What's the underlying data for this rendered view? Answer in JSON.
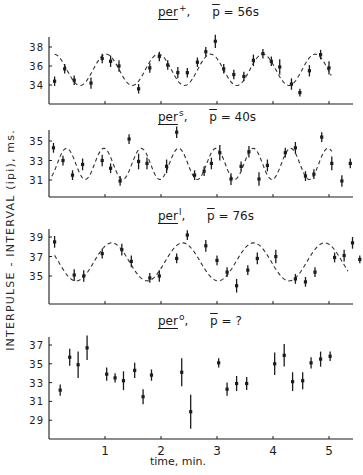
{
  "y_axis_label": "INTERPULSE - INTERVAL (ipi), ms.",
  "x_axis_label": "time, min.",
  "x_ticks": [
    "1",
    "2",
    "3",
    "4",
    "5"
  ],
  "panels": [
    {
      "gene": "per",
      "allele": "+",
      "period_label": "p",
      "period_value": "= 56s"
    },
    {
      "gene": "per",
      "allele": "s",
      "period_label": "p",
      "period_value": "= 40s"
    },
    {
      "gene": "per",
      "allele": "l",
      "period_label": "p",
      "period_value": "= 76s"
    },
    {
      "gene": "per",
      "allele": "o",
      "period_label": "p",
      "period_value": "= ?"
    }
  ],
  "chart_data": [
    {
      "type": "scatter",
      "title": "per+, p̄ = 56s",
      "xlabel": "time, min.",
      "ylabel": "INTERPULSE - INTERVAL (ipi), ms.",
      "xlim": [
        0,
        5.43
      ],
      "ylim": [
        32.0,
        38.8
      ],
      "yticks": [
        34,
        36,
        38
      ],
      "fit": {
        "type": "sine",
        "mean": 35.6,
        "amplitude": 1.65,
        "period_min": 0.933,
        "phase_peak_min": 1.02,
        "x_start": 0.1,
        "x_end": 5.05
      },
      "points": [
        {
          "x": 0.1,
          "y": 34.4,
          "err": 0.5
        },
        {
          "x": 0.28,
          "y": 35.7,
          "err": 0.5
        },
        {
          "x": 0.45,
          "y": 34.5,
          "err": 0.5
        },
        {
          "x": 0.75,
          "y": 34.2,
          "err": 0.6
        },
        {
          "x": 0.95,
          "y": 36.8,
          "err": 0.5
        },
        {
          "x": 1.1,
          "y": 36.5,
          "err": 0.6
        },
        {
          "x": 1.25,
          "y": 36.0,
          "err": 0.6
        },
        {
          "x": 1.6,
          "y": 33.6,
          "err": 0.5
        },
        {
          "x": 1.8,
          "y": 35.8,
          "err": 0.5
        },
        {
          "x": 1.97,
          "y": 37.0,
          "err": 0.5
        },
        {
          "x": 2.12,
          "y": 36.1,
          "err": 0.5
        },
        {
          "x": 2.3,
          "y": 35.3,
          "err": 0.6
        },
        {
          "x": 2.47,
          "y": 35.3,
          "err": 0.5
        },
        {
          "x": 2.65,
          "y": 36.4,
          "err": 0.5
        },
        {
          "x": 2.8,
          "y": 37.5,
          "err": 0.5
        },
        {
          "x": 2.97,
          "y": 38.6,
          "err": 0.7
        },
        {
          "x": 3.12,
          "y": 35.7,
          "err": 0.5
        },
        {
          "x": 3.3,
          "y": 35.1,
          "err": 0.5
        },
        {
          "x": 3.48,
          "y": 34.9,
          "err": 0.5
        },
        {
          "x": 3.65,
          "y": 36.6,
          "err": 0.6
        },
        {
          "x": 3.82,
          "y": 37.3,
          "err": 0.5
        },
        {
          "x": 3.97,
          "y": 36.5,
          "err": 0.5
        },
        {
          "x": 4.12,
          "y": 35.9,
          "err": 0.8
        },
        {
          "x": 4.33,
          "y": 34.1,
          "err": 0.6
        },
        {
          "x": 4.48,
          "y": 33.2,
          "err": 0.4
        },
        {
          "x": 4.65,
          "y": 35.5,
          "err": 0.6
        },
        {
          "x": 4.85,
          "y": 37.2,
          "err": 0.5
        },
        {
          "x": 5.0,
          "y": 35.8,
          "err": 0.7
        }
      ]
    },
    {
      "type": "scatter",
      "title": "pers, p̄ = 40s",
      "xlabel": "time, min.",
      "ylabel": "INTERPULSE - INTERVAL (ipi), ms.",
      "xlim": [
        0,
        5.43
      ],
      "ylim": [
        29.3,
        36.2
      ],
      "yticks": [
        31,
        33,
        35
      ],
      "fit": {
        "type": "sine",
        "mean": 32.65,
        "amplitude": 1.6,
        "period_min": 0.667,
        "phase_peak_min": 0.98,
        "x_start": 0.05,
        "x_end": 5.05
      },
      "points": [
        {
          "x": 0.08,
          "y": 34.3,
          "err": 0.5
        },
        {
          "x": 0.25,
          "y": 33.0,
          "err": 0.5
        },
        {
          "x": 0.42,
          "y": 31.5,
          "err": 0.5
        },
        {
          "x": 0.6,
          "y": 32.6,
          "err": 0.6
        },
        {
          "x": 0.95,
          "y": 33.0,
          "err": 0.6
        },
        {
          "x": 1.1,
          "y": 32.2,
          "err": 0.5
        },
        {
          "x": 1.27,
          "y": 30.9,
          "err": 0.5
        },
        {
          "x": 1.43,
          "y": 35.2,
          "err": 0.5
        },
        {
          "x": 1.6,
          "y": 32.9,
          "err": 0.8
        },
        {
          "x": 1.75,
          "y": 32.7,
          "err": 0.6
        },
        {
          "x": 2.1,
          "y": 32.4,
          "err": 0.7
        },
        {
          "x": 2.28,
          "y": 35.9,
          "err": 0.6
        },
        {
          "x": 2.6,
          "y": 31.5,
          "err": 0.5
        },
        {
          "x": 2.77,
          "y": 31.9,
          "err": 0.5
        },
        {
          "x": 2.9,
          "y": 32.7,
          "err": 0.6
        },
        {
          "x": 3.05,
          "y": 33.8,
          "err": 0.8
        },
        {
          "x": 3.25,
          "y": 31.1,
          "err": 0.6
        },
        {
          "x": 3.43,
          "y": 32.4,
          "err": 0.5
        },
        {
          "x": 3.57,
          "y": 33.9,
          "err": 0.6
        },
        {
          "x": 3.75,
          "y": 31.1,
          "err": 0.7
        },
        {
          "x": 3.9,
          "y": 32.5,
          "err": 0.6
        },
        {
          "x": 4.22,
          "y": 33.8,
          "err": 0.5
        },
        {
          "x": 4.4,
          "y": 34.3,
          "err": 0.6
        },
        {
          "x": 4.58,
          "y": 31.4,
          "err": 0.5
        },
        {
          "x": 4.73,
          "y": 31.6,
          "err": 0.5
        },
        {
          "x": 4.87,
          "y": 35.4,
          "err": 0.5
        },
        {
          "x": 5.05,
          "y": 32.7,
          "err": 0.7
        },
        {
          "x": 5.23,
          "y": 30.9,
          "err": 0.6
        },
        {
          "x": 5.38,
          "y": 32.7,
          "err": 0.5
        }
      ]
    },
    {
      "type": "scatter",
      "title": "perl, p̄ = 76s",
      "xlabel": "time, min.",
      "ylabel": "INTERPULSE - INTERVAL (ipi), ms.",
      "xlim": [
        0,
        5.43
      ],
      "ylim": [
        32.2,
        39.8
      ],
      "yticks": [
        35,
        37,
        39
      ],
      "fit": {
        "type": "sine",
        "mean": 36.45,
        "amplitude": 1.95,
        "period_min": 1.267,
        "phase_peak_min": 1.12,
        "x_start": 0.1,
        "x_end": 5.35
      },
      "points": [
        {
          "x": 0.1,
          "y": 38.5,
          "err": 0.6
        },
        {
          "x": 0.45,
          "y": 35.1,
          "err": 0.6
        },
        {
          "x": 0.62,
          "y": 35.0,
          "err": 0.6
        },
        {
          "x": 0.95,
          "y": 37.3,
          "err": 0.5
        },
        {
          "x": 1.3,
          "y": 37.7,
          "err": 0.6
        },
        {
          "x": 1.47,
          "y": 36.5,
          "err": 0.6
        },
        {
          "x": 1.8,
          "y": 34.8,
          "err": 0.5
        },
        {
          "x": 1.97,
          "y": 35.0,
          "err": 0.6
        },
        {
          "x": 2.28,
          "y": 36.8,
          "err": 0.5
        },
        {
          "x": 2.47,
          "y": 39.2,
          "err": 0.5
        },
        {
          "x": 2.8,
          "y": 38.1,
          "err": 0.6
        },
        {
          "x": 3.0,
          "y": 36.6,
          "err": 0.5
        },
        {
          "x": 3.18,
          "y": 35.4,
          "err": 0.5
        },
        {
          "x": 3.35,
          "y": 34.0,
          "err": 0.7
        },
        {
          "x": 3.55,
          "y": 35.6,
          "err": 0.5
        },
        {
          "x": 3.72,
          "y": 36.8,
          "err": 0.6
        },
        {
          "x": 4.05,
          "y": 37.0,
          "err": 0.7
        },
        {
          "x": 4.4,
          "y": 34.7,
          "err": 0.5
        },
        {
          "x": 4.58,
          "y": 34.4,
          "err": 0.5
        },
        {
          "x": 4.75,
          "y": 35.4,
          "err": 0.5
        },
        {
          "x": 5.1,
          "y": 36.9,
          "err": 0.5
        },
        {
          "x": 5.27,
          "y": 37.1,
          "err": 0.6
        },
        {
          "x": 5.42,
          "y": 38.4,
          "err": 0.6
        },
        {
          "x": 5.55,
          "y": 36.7,
          "err": 0.4
        }
      ]
    },
    {
      "type": "scatter",
      "title": "pero, p̄ = ?",
      "xlabel": "time, min.",
      "ylabel": "INTERPULSE - INTERVAL (ipi), ms.",
      "xlim": [
        0,
        5.43
      ],
      "ylim": [
        27.0,
        37.8
      ],
      "yticks": [
        29,
        31,
        33,
        35,
        37
      ],
      "fit": null,
      "points": [
        {
          "x": 0.2,
          "y": 32.2,
          "err": 0.6
        },
        {
          "x": 0.37,
          "y": 35.7,
          "err": 0.9
        },
        {
          "x": 0.52,
          "y": 34.9,
          "err": 1.4
        },
        {
          "x": 0.68,
          "y": 36.7,
          "err": 1.3
        },
        {
          "x": 1.03,
          "y": 33.9,
          "err": 0.7
        },
        {
          "x": 1.18,
          "y": 33.5,
          "err": 0.5
        },
        {
          "x": 1.33,
          "y": 33.2,
          "err": 1.0
        },
        {
          "x": 1.53,
          "y": 34.3,
          "err": 0.8
        },
        {
          "x": 1.68,
          "y": 31.5,
          "err": 0.8
        },
        {
          "x": 1.83,
          "y": 33.8,
          "err": 0.6
        },
        {
          "x": 2.37,
          "y": 34.1,
          "err": 1.5
        },
        {
          "x": 2.53,
          "y": 29.9,
          "err": 1.8
        },
        {
          "x": 3.03,
          "y": 35.1,
          "err": 0.5
        },
        {
          "x": 3.18,
          "y": 32.3,
          "err": 0.7
        },
        {
          "x": 3.35,
          "y": 32.9,
          "err": 0.8
        },
        {
          "x": 3.53,
          "y": 32.9,
          "err": 0.7
        },
        {
          "x": 4.03,
          "y": 35.0,
          "err": 1.2
        },
        {
          "x": 4.2,
          "y": 35.9,
          "err": 1.2
        },
        {
          "x": 4.35,
          "y": 33.1,
          "err": 1.0
        },
        {
          "x": 4.53,
          "y": 33.2,
          "err": 0.9
        },
        {
          "x": 4.68,
          "y": 35.1,
          "err": 0.6
        },
        {
          "x": 4.85,
          "y": 35.5,
          "err": 0.8
        },
        {
          "x": 5.02,
          "y": 35.8,
          "err": 0.5
        }
      ]
    }
  ]
}
